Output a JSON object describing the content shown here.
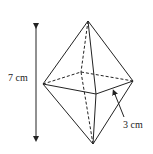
{
  "diagram": {
    "height_label": "7 cm",
    "side_label": "3 cm",
    "colors": {
      "stroke": "#222222",
      "background": "#ffffff"
    }
  }
}
